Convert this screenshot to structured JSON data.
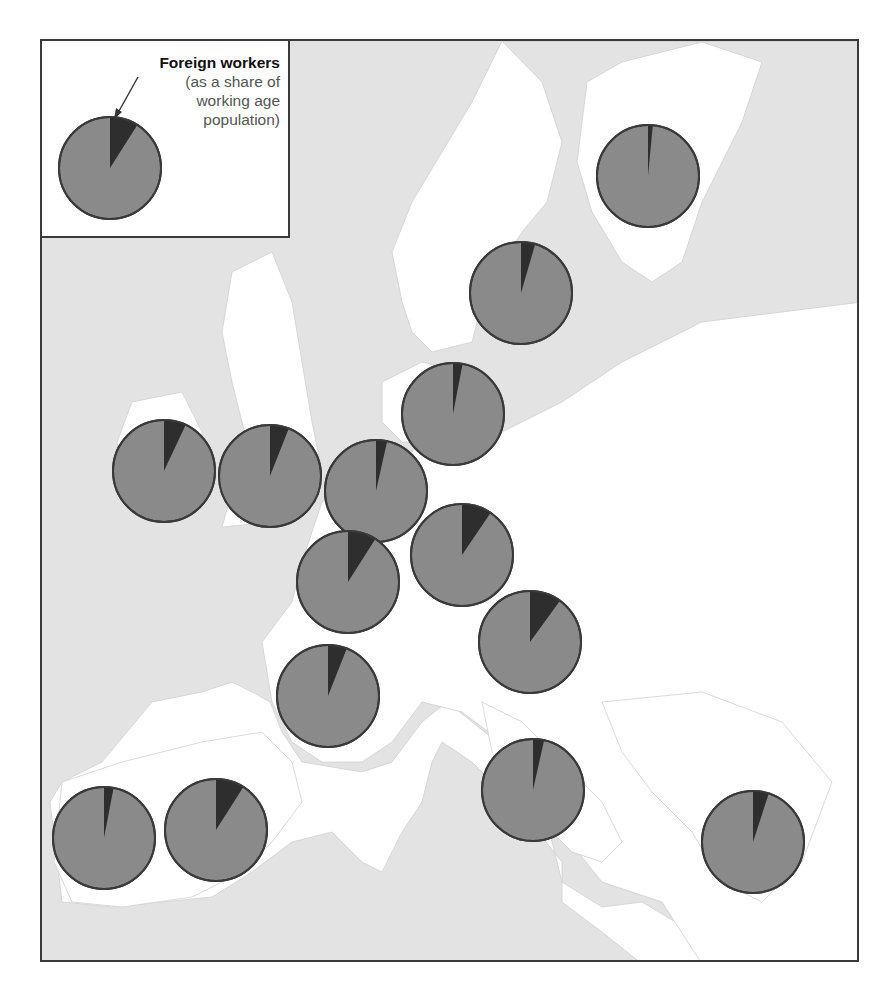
{
  "legend": {
    "title": "Foreign workers",
    "subtitle_lines": [
      "(as a share of",
      "working age",
      "population)"
    ],
    "example_share_pct": 9
  },
  "colors": {
    "sea": "#e3e3e3",
    "land": "#ffffff",
    "border": "#d0d0d0",
    "pie_body": "#8a8a8a",
    "pie_slice": "#2e2e2e",
    "pie_outline": "#3a3a3a",
    "frame": "#3a3a3a"
  },
  "chart_data": {
    "type": "pie",
    "title": "Foreign workers (as a share of working age population)",
    "map_region": "Western Europe",
    "note": "Country labels are not printed; names are inferred from pie location on the map. Shares estimated from slice angles.",
    "series": [
      {
        "name": "Finland",
        "lat": 62.5,
        "lon": 26.0,
        "share_pct": 1.5
      },
      {
        "name": "Sweden",
        "lat": 59.5,
        "lon": 16.0,
        "share_pct": 4.5
      },
      {
        "name": "Denmark",
        "lat": 56.0,
        "lon": 10.5,
        "share_pct": 3
      },
      {
        "name": "Ireland",
        "lat": 53.2,
        "lon": -8.0,
        "share_pct": 7
      },
      {
        "name": "United Kingdom",
        "lat": 53.0,
        "lon": -1.5,
        "share_pct": 6
      },
      {
        "name": "Netherlands",
        "lat": 52.3,
        "lon": 5.5,
        "share_pct": 3.5
      },
      {
        "name": "Belgium",
        "lat": 50.2,
        "lon": 4.0,
        "share_pct": 9
      },
      {
        "name": "Germany",
        "lat": 50.8,
        "lon": 10.0,
        "share_pct": 9.5
      },
      {
        "name": "Austria",
        "lat": 47.5,
        "lon": 14.0,
        "share_pct": 10
      },
      {
        "name": "France",
        "lat": 46.5,
        "lon": 2.5,
        "share_pct": 6
      },
      {
        "name": "Italy",
        "lat": 42.5,
        "lon": 13.0,
        "share_pct": 3.5
      },
      {
        "name": "Portugal",
        "lat": 39.5,
        "lon": -8.0,
        "share_pct": 3
      },
      {
        "name": "Spain",
        "lat": 40.0,
        "lon": -3.5,
        "share_pct": 9
      },
      {
        "name": "Greece",
        "lat": 39.0,
        "lon": 22.0,
        "share_pct": 5
      }
    ]
  }
}
